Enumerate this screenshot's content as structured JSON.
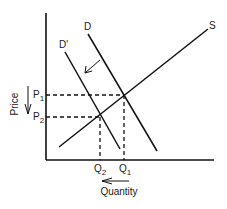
{
  "title": "",
  "axes": {
    "y_label": "Price",
    "x_label": "Quantity"
  },
  "curves": {
    "supply": {
      "label": "S"
    },
    "demand_original": {
      "label": "D"
    },
    "demand_shifted": {
      "label": "D'"
    }
  },
  "levels": {
    "p1": {
      "main": "P",
      "sub": "1"
    },
    "p2": {
      "main": "P",
      "sub": "2"
    },
    "q1": {
      "main": "Q",
      "sub": "1"
    },
    "q2": {
      "main": "Q",
      "sub": "2"
    }
  },
  "annotations": {
    "demand_shift": "demand curve shifts left from D to D'",
    "price_change": "price falls from P1 to P2",
    "quantity_change": "quantity falls from Q1 to Q2"
  },
  "colors": {
    "line": "#111111",
    "background": "#ffffff"
  }
}
